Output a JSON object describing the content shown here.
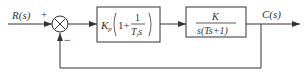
{
  "diagram": {
    "type": "block-diagram",
    "input": {
      "label": "R(s)"
    },
    "summing_junction": {
      "symbol": "×",
      "plus_sign": "+",
      "minus_sign": "−"
    },
    "controller_block": {
      "gain": "K",
      "gain_sub": "p",
      "open": "(1+",
      "num": "1",
      "den_T": "T",
      "den_sub": "i",
      "den_s": "s",
      "close": ")"
    },
    "plant_block": {
      "num": "K",
      "den": "s(Ts+1)"
    },
    "output": {
      "label": "C(s)"
    },
    "feedback": "unity negative feedback"
  }
}
